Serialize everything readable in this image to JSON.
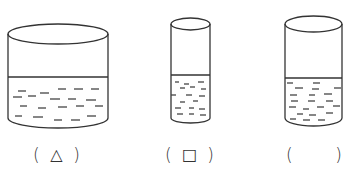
{
  "diagram": {
    "title": "",
    "stroke_color": "#333333",
    "dash_color": "#444444",
    "background": "#ffffff",
    "containers": [
      {
        "id": "container-1",
        "shape": "cylinder",
        "description": "wide short cylinder, water just over half full",
        "left": 8,
        "right": 108,
        "top_y": 34,
        "top_ry": 10,
        "bottom_y": 118,
        "bottom_ry": 10,
        "water_y": 77,
        "dashes": [
          [
            18,
            91,
            26,
            91
          ],
          [
            40,
            93,
            49,
            93
          ],
          [
            58,
            89,
            66,
            89
          ],
          [
            74,
            89,
            83,
            89
          ],
          [
            91,
            89,
            99,
            89
          ],
          [
            13,
            97,
            22,
            97
          ],
          [
            28,
            96,
            36,
            96
          ],
          [
            50,
            99,
            60,
            99
          ],
          [
            68,
            99,
            76,
            99
          ],
          [
            86,
            100,
            96,
            100
          ],
          [
            20,
            106,
            27,
            106
          ],
          [
            38,
            108,
            46,
            108
          ],
          [
            58,
            107,
            67,
            107
          ],
          [
            76,
            106,
            84,
            106
          ],
          [
            95,
            106,
            103,
            106
          ],
          [
            15,
            116,
            22,
            116
          ],
          [
            33,
            117,
            43,
            117
          ],
          [
            54,
            120,
            62,
            120
          ],
          [
            71,
            120,
            80,
            120
          ],
          [
            87,
            116,
            96,
            116
          ]
        ],
        "label": {
          "open": "(",
          "mark": "△",
          "close": ")",
          "left": 33,
          "right": 80
        }
      },
      {
        "id": "container-2",
        "shape": "cylinder",
        "description": "narrow tall cylinder, water under half full",
        "left": 171,
        "right": 210,
        "top_y": 24,
        "top_ry": 6,
        "bottom_y": 118,
        "bottom_ry": 5,
        "water_y": 75,
        "dashes": [
          [
            175,
            82,
            179,
            82
          ],
          [
            184,
            84,
            189,
            84
          ],
          [
            198,
            82,
            204,
            82
          ],
          [
            180,
            88,
            185,
            88
          ],
          [
            190,
            87,
            195,
            87
          ],
          [
            201,
            89,
            206,
            89
          ],
          [
            171,
            95,
            176,
            95
          ],
          [
            186,
            95,
            192,
            95
          ],
          [
            199,
            96,
            205,
            96
          ],
          [
            180,
            102,
            185,
            102
          ],
          [
            193,
            101,
            198,
            101
          ],
          [
            175,
            108,
            181,
            108
          ],
          [
            189,
            108,
            194,
            108
          ],
          [
            199,
            109,
            205,
            109
          ],
          [
            177,
            114,
            183,
            114
          ],
          [
            189,
            114,
            194,
            114
          ],
          [
            200,
            115,
            206,
            115
          ]
        ],
        "label": {
          "open": "(",
          "mark": "□",
          "close": ")",
          "left": 165,
          "right": 214
        }
      },
      {
        "id": "container-3",
        "shape": "cylinder",
        "description": "medium cylinder, water under half full",
        "left": 285,
        "right": 342,
        "top_y": 24,
        "top_ry": 8,
        "bottom_y": 118,
        "bottom_ry": 8,
        "water_y": 78,
        "dashes": [
          [
            287,
            83,
            293,
            83
          ],
          [
            313,
            83,
            320,
            83
          ],
          [
            295,
            88,
            303,
            88
          ],
          [
            312,
            89,
            319,
            89
          ],
          [
            334,
            88,
            341,
            88
          ],
          [
            290,
            95,
            297,
            95
          ],
          [
            309,
            95,
            315,
            95
          ],
          [
            324,
            94,
            332,
            94
          ],
          [
            291,
            101,
            298,
            101
          ],
          [
            308,
            101,
            315,
            101
          ],
          [
            326,
            101,
            333,
            101
          ],
          [
            289,
            107,
            296,
            107
          ],
          [
            303,
            109,
            309,
            109
          ],
          [
            317,
            107,
            324,
            107
          ],
          [
            333,
            106,
            340,
            106
          ],
          [
            297,
            114,
            303,
            114
          ],
          [
            309,
            115,
            316,
            115
          ],
          [
            326,
            113,
            333,
            113
          ],
          [
            290,
            119,
            296,
            119
          ],
          [
            303,
            120,
            310,
            120
          ],
          [
            318,
            120,
            325,
            120
          ]
        ],
        "label": {
          "open": "(",
          "mark": "",
          "close": ")",
          "left": 286,
          "right": 342
        }
      }
    ]
  }
}
